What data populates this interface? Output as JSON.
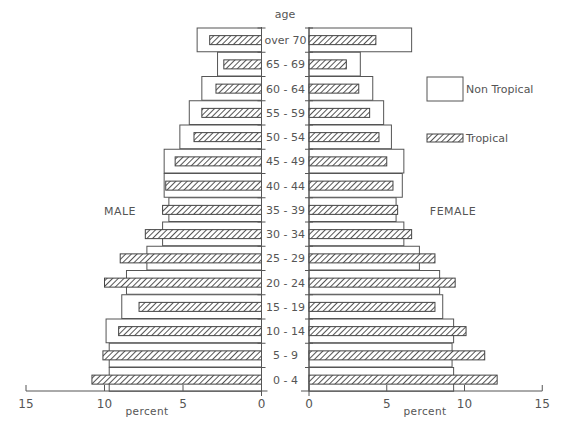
{
  "chart_data": {
    "type": "bar",
    "subtype": "population-pyramid",
    "title": "",
    "y_axis_title": "age",
    "xlabel_left": "percent",
    "xlabel_right": "percent",
    "side_labels": {
      "left": "MALE",
      "right": "FEMALE"
    },
    "left_ticks": [
      15,
      10,
      5,
      0
    ],
    "right_ticks": [
      0,
      5,
      10,
      15
    ],
    "xlim": [
      0,
      15
    ],
    "legend": [
      {
        "name": "Non Tropical",
        "style": "open-box"
      },
      {
        "name": "Tropical",
        "style": "hatched"
      }
    ],
    "categories": [
      "over 70",
      "65 - 69",
      "60 - 64",
      "55 - 59",
      "50 - 54",
      "45 - 49",
      "40 - 44",
      "35 - 39",
      "30 - 34",
      "25 - 29",
      "20 - 24",
      "15 - 19",
      "10 - 14",
      "5 - 9",
      "0 - 4"
    ],
    "series": [
      {
        "name": "Male Non Tropical",
        "values": [
          4.1,
          2.8,
          3.8,
          4.6,
          5.2,
          6.2,
          6.2,
          5.9,
          6.3,
          7.3,
          8.6,
          8.9,
          9.9,
          9.7,
          9.7
        ]
      },
      {
        "name": "Male Tropical",
        "values": [
          3.3,
          2.4,
          2.9,
          3.8,
          4.3,
          5.5,
          6.1,
          6.3,
          7.4,
          9.0,
          10.0,
          7.8,
          9.1,
          10.1,
          10.8
        ]
      },
      {
        "name": "Female Non Tropical",
        "values": [
          6.6,
          3.3,
          4.1,
          4.8,
          5.3,
          6.1,
          6.0,
          5.6,
          6.1,
          7.1,
          8.4,
          8.6,
          9.3,
          9.2,
          9.3
        ]
      },
      {
        "name": "Female Tropical",
        "values": [
          4.3,
          2.4,
          3.2,
          3.9,
          4.5,
          5.0,
          5.4,
          5.7,
          6.6,
          8.1,
          9.4,
          8.1,
          10.1,
          11.3,
          12.1
        ]
      }
    ],
    "grid": false,
    "legend_position": "right"
  }
}
